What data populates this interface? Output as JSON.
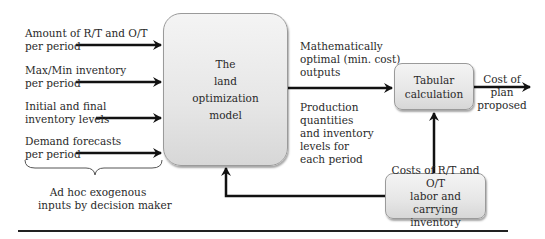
{
  "inputs": [
    {
      "line1": "Amount of R/T and O/T",
      "line2": "per period"
    },
    {
      "line1": "Max/Min inventory",
      "line2": "per period"
    },
    {
      "line1": "Initial and final",
      "line2": "inventory levels"
    },
    {
      "line1": "Demand forecasts",
      "line2": "per period"
    }
  ],
  "brace_label": {
    "line1": "Ad hoc exogenous",
    "line2": "inputs by decision maker"
  },
  "main_box": {
    "line1": "The",
    "line2": "land",
    "line3": "optimization",
    "line4": "model"
  },
  "output_labels": {
    "upper": {
      "line1": "Mathematically",
      "line2": "optimal (min. cost)",
      "line3": "outputs"
    },
    "lower": {
      "line1": "Production",
      "line2": "quantities",
      "line3": "and inventory",
      "line4": "levels for",
      "line5": "each period"
    }
  },
  "tabular_box": {
    "line1": "Tabular",
    "line2": "calculation"
  },
  "final_output": {
    "line1": "Cost of",
    "line2": "plan",
    "line3": "proposed"
  },
  "costs_box": {
    "line1": "Costs of R/T and O/T",
    "line2": "labor and carrying",
    "line3": "inventory"
  },
  "colors": {
    "arrow": "#111111",
    "box_border": "#9a9a9a",
    "box_fill": "#e6e6e6"
  }
}
